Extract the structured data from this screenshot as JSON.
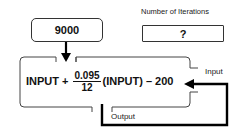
{
  "input_box": {
    "value": "9000"
  },
  "iterations": {
    "label": "Number of Iterations",
    "value": "?"
  },
  "formula": {
    "prefix": "INPUT +",
    "numerator": "0.095",
    "denominator": "12",
    "suffix": "(INPUT) – 200"
  },
  "labels": {
    "input": "Input",
    "output": "Output"
  }
}
